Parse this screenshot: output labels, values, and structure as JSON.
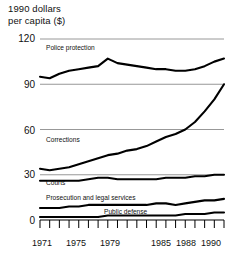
{
  "chart_data": {
    "type": "line",
    "title_line1": "1990 dollars",
    "title_line2": "per capita ($)",
    "xlabel": "",
    "ylabel": "1990 dollars per capita ($)",
    "ylim": [
      0,
      120
    ],
    "xlim": [
      1971,
      1990
    ],
    "grid": true,
    "grid_lines_at": [
      30,
      60,
      90,
      120
    ],
    "legend_position": "inline-above-each-series",
    "ytick_labels": [
      "120",
      "90",
      "60",
      "30",
      "0"
    ],
    "ytick_values": [
      120,
      90,
      60,
      30,
      0
    ],
    "xtick_labels": [
      "1971",
      "1975",
      "1979",
      "1985",
      "1988",
      "1990"
    ],
    "xtick_values": [
      1971,
      1975,
      1979,
      1985,
      1988,
      1990
    ],
    "x": [
      1971,
      1972,
      1973,
      1974,
      1975,
      1976,
      1977,
      1978,
      1979,
      1980,
      1981,
      1982,
      1983,
      1984,
      1985,
      1986,
      1987,
      1988,
      1989,
      1990
    ],
    "series": [
      {
        "name": "Police protection",
        "values": [
          95,
          94,
          97,
          99,
          100,
          101,
          102,
          107,
          104,
          103,
          102,
          101,
          100,
          100,
          99,
          99,
          100,
          102,
          105,
          107
        ]
      },
      {
        "name": "Corrections",
        "values": [
          34,
          33,
          34,
          35,
          37,
          39,
          41,
          43,
          44,
          46,
          47,
          49,
          52,
          55,
          57,
          60,
          65,
          72,
          80,
          90
        ]
      },
      {
        "name": "Courts",
        "values": [
          26,
          26,
          26,
          26,
          26,
          27,
          28,
          28,
          27,
          27,
          27,
          27,
          27,
          28,
          28,
          28,
          29,
          29,
          30,
          30
        ]
      },
      {
        "name": "Prosecution and legal services",
        "values": [
          8,
          8,
          8,
          9,
          9,
          10,
          10,
          10,
          10,
          10,
          10,
          10,
          11,
          11,
          10,
          11,
          12,
          13,
          13,
          14
        ]
      },
      {
        "name": "Public defense",
        "values": [
          2,
          2,
          2,
          2,
          2,
          2,
          2,
          3,
          3,
          3,
          3,
          3,
          3,
          3,
          3,
          4,
          4,
          4,
          5,
          5
        ]
      }
    ]
  },
  "series_labels": {
    "police": "Police protection",
    "corrections": "Corrections",
    "courts": "Courts",
    "prosecution": "Prosecution and legal services",
    "public_defense": "Public defense"
  },
  "colors": {
    "line": "#000000",
    "grid": "#8c8c8c",
    "axis": "#000000",
    "text": "#111111",
    "background": "#ffffff"
  }
}
